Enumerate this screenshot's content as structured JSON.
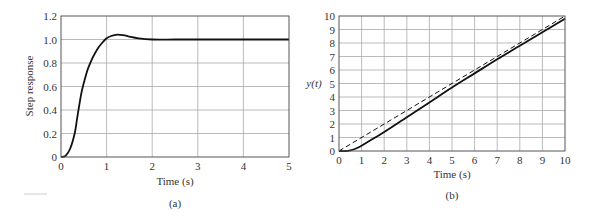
{
  "chart_data": [
    {
      "type": "line",
      "panel": "(a)",
      "title": "",
      "xlabel": "Time (s)",
      "ylabel": "Step response",
      "xlim": [
        0,
        5
      ],
      "ylim": [
        0,
        1.2
      ],
      "xticks": [
        "0",
        "1",
        "2",
        "3",
        "4",
        "5"
      ],
      "yticks": [
        "0",
        "0.2",
        "0.4",
        "0.6",
        "0.8",
        "1.0",
        "1.2"
      ],
      "grid": true,
      "series": [
        {
          "name": "step response",
          "style": "solid",
          "x": [
            0,
            0.1,
            0.2,
            0.3,
            0.35,
            0.4,
            0.45,
            0.5,
            0.55,
            0.6,
            0.7,
            0.8,
            0.9,
            1.0,
            1.1,
            1.2,
            1.3,
            1.4,
            1.5,
            1.7,
            2.0,
            2.5,
            3.0,
            4.0,
            5.0
          ],
          "values": [
            0,
            0.01,
            0.07,
            0.2,
            0.32,
            0.44,
            0.55,
            0.63,
            0.7,
            0.76,
            0.85,
            0.92,
            0.97,
            1.01,
            1.03,
            1.04,
            1.04,
            1.035,
            1.025,
            1.01,
            1.0,
            1.0,
            1.0,
            1.0,
            1.0
          ]
        }
      ]
    },
    {
      "type": "line",
      "panel": "(b)",
      "title": "",
      "xlabel": "Time (s)",
      "ylabel": "y(t)",
      "xlim": [
        0,
        10
      ],
      "ylim": [
        0,
        10
      ],
      "xticks": [
        "0",
        "1",
        "2",
        "3",
        "4",
        "5",
        "6",
        "7",
        "8",
        "9",
        "10"
      ],
      "yticks": [
        "0",
        "1",
        "2",
        "3",
        "4",
        "5",
        "6",
        "7",
        "8",
        "9",
        "10"
      ],
      "grid": true,
      "series": [
        {
          "name": "reference (ramp)",
          "style": "dashed",
          "x": [
            0,
            10
          ],
          "values": [
            0,
            10
          ]
        },
        {
          "name": "output y(t)",
          "style": "solid",
          "x": [
            0,
            0.3,
            0.5,
            0.7,
            0.9,
            1.1,
            1.3,
            1.6,
            2,
            3,
            4,
            5,
            6,
            7,
            8,
            9,
            10
          ],
          "values": [
            0,
            0.0,
            0.05,
            0.15,
            0.3,
            0.5,
            0.7,
            1.0,
            1.4,
            2.5,
            3.6,
            4.7,
            5.75,
            6.8,
            7.8,
            8.8,
            9.8
          ]
        }
      ]
    }
  ],
  "panels": {
    "a": {
      "caption": "(a)",
      "xlabel": "Time (s)",
      "ylabel": "Step response"
    },
    "b": {
      "caption": "(b)",
      "xlabel": "Time (s)",
      "ylabel": "y(t)"
    }
  }
}
